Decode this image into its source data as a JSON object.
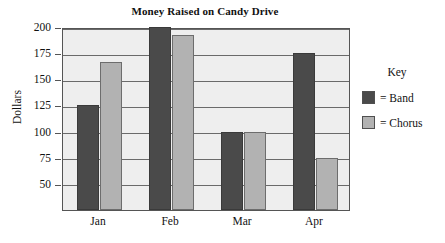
{
  "chart_data": {
    "type": "bar",
    "title": "Money Raised on Candy Drive",
    "xlabel": "",
    "ylabel": "Dollars",
    "categories": [
      "Jan",
      "Feb",
      "Mar",
      "Apr"
    ],
    "series": [
      {
        "name": "Band",
        "values": [
          125,
          200,
          100,
          175
        ]
      },
      {
        "name": "Chorus",
        "values": [
          167,
          192,
          100,
          75
        ]
      }
    ],
    "ylim": [
      25,
      200
    ],
    "yticks": [
      50,
      75,
      100,
      125,
      150,
      175,
      200
    ],
    "ytick_labels": [
      "50",
      "75",
      "100",
      "125",
      "150",
      "175",
      "200"
    ],
    "grid": true,
    "legend_position": "right",
    "legend_title": "Key",
    "legend_entries": [
      {
        "label": "= Band",
        "color": "#4a4a4a"
      },
      {
        "label": "= Chorus",
        "color": "#b2b2b2"
      }
    ],
    "colors": {
      "band": "#4a4a4a",
      "chorus": "#b2b2b2",
      "plot_background": "#eeeeee",
      "axis": "#555555",
      "gridline": "#6a6a6a"
    }
  }
}
